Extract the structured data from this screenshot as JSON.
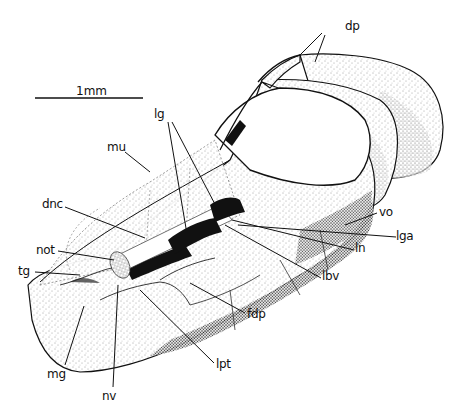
{
  "figure": {
    "type": "anatomical-illustration",
    "colors": {
      "ink": "#111111",
      "background": "#ffffff",
      "stipple": "#555555"
    }
  },
  "scale_bar": {
    "label": "1mm",
    "x1": 35,
    "x2": 143,
    "y": 98
  },
  "labels": {
    "dp": "dp",
    "lg": "lg",
    "mu": "mu",
    "dnc": "dnc",
    "not": "not",
    "tg": "tg",
    "mg": "mg",
    "nv": "nv",
    "lpt": "lpt",
    "fdp": "fdp",
    "lbv": "lbv",
    "ln": "ln",
    "lga": "lga",
    "vo": "vo"
  }
}
